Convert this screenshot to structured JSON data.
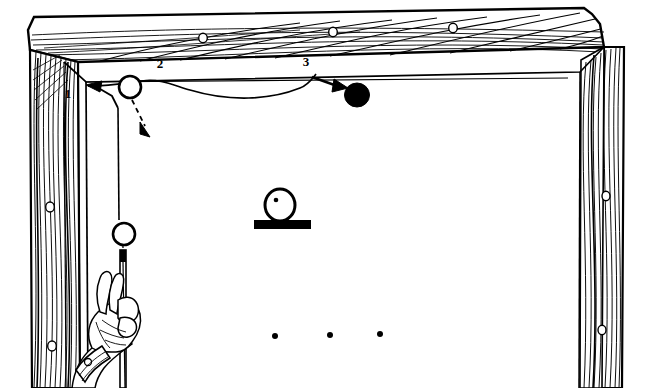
{
  "figure": {
    "background_color": "#ffffff",
    "ink_color": "#000000",
    "width": 647,
    "height": 388,
    "style": "black-and-white line engraving"
  },
  "labels": {
    "step_1": "1",
    "step_2": "2",
    "step_3": "3"
  },
  "label_positions": {
    "step_1": {
      "x": 68,
      "y": 98
    },
    "step_2": {
      "x": 160,
      "y": 68
    },
    "step_3": {
      "x": 306,
      "y": 66
    }
  },
  "frame": {
    "name": "wooden-door-frame",
    "lintel": {
      "name": "top-beam",
      "grain": "diagonal",
      "knot_holes": [
        {
          "x": 203,
          "y": 38,
          "r": 4
        },
        {
          "x": 333,
          "y": 32,
          "r": 4
        },
        {
          "x": 453,
          "y": 28,
          "r": 4
        }
      ]
    },
    "left_post": {
      "name": "left-post",
      "grain": "vertical",
      "knot_holes": [
        {
          "x": 50,
          "y": 207,
          "r": 4
        },
        {
          "x": 52,
          "y": 346,
          "r": 4
        }
      ]
    },
    "right_post": {
      "name": "right-post",
      "grain": "vertical",
      "knot_holes": [
        {
          "x": 606,
          "y": 196,
          "r": 4
        },
        {
          "x": 602,
          "y": 330,
          "r": 4
        }
      ]
    }
  },
  "elements": {
    "ring_on_cord": {
      "name": "open-ring-upper",
      "shape": "circle-outline",
      "cx": 130,
      "cy": 87,
      "r": 11
    },
    "ring_on_rod": {
      "name": "open-ring-lower",
      "shape": "circle-outline",
      "cx": 124,
      "cy": 234,
      "r": 11
    },
    "black_ball": {
      "name": "black-ball",
      "shape": "circle-filled",
      "cx": 357,
      "cy": 95,
      "r": 12
    },
    "pedestal_ball": {
      "name": "pedestal-ball",
      "shape": "circle-outline-with-dot",
      "cx": 280,
      "cy": 205,
      "r": 15,
      "dot": {
        "cx": 276,
        "cy": 201,
        "r": 2
      }
    },
    "pedestal_base": {
      "name": "pedestal-base",
      "shape": "filled-rectangle",
      "x": 255,
      "y": 220,
      "width": 56,
      "height": 9
    },
    "dots_row": {
      "name": "bottom-dot-row",
      "shape": "three-dots",
      "points": [
        {
          "x": 275,
          "y": 336
        },
        {
          "x": 330,
          "y": 335
        },
        {
          "x": 380,
          "y": 334
        }
      ],
      "radius": 3
    },
    "hand": {
      "name": "hand-holding-rod",
      "description": "left hand gripping a vertical rod, wrist band visible"
    },
    "rod": {
      "name": "vertical-rod",
      "x_top": 124,
      "y_top": 245,
      "x_bottom": 128,
      "y_bottom": 388
    },
    "cord": {
      "name": "suspension-cord",
      "description": "cord running from left post across to the black ball"
    }
  },
  "annotations": {
    "arrow_1": {
      "name": "arrow-step-1",
      "direction": "left",
      "style": "solid",
      "description": "solid arrow pointing left toward the post at step 1"
    },
    "arrow_2": {
      "name": "arrow-step-2",
      "direction": "down-right",
      "style": "dashed",
      "description": "dashed arrow pointing down-right from the upper ring"
    },
    "arrow_3": {
      "name": "arrow-step-3",
      "direction": "right",
      "style": "solid",
      "description": "solid arrow pointing right toward the black ball"
    }
  }
}
